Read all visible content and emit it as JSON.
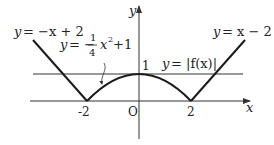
{
  "diagram": {
    "type": "function-graph",
    "axes": {
      "x_label": "x",
      "y_label": "y",
      "origin_label": "O",
      "x_ticks": [
        "-2",
        "2"
      ],
      "y_ticks": [
        "1"
      ]
    },
    "curves": [
      {
        "name": "left-line",
        "equation": "y = -x + 2",
        "label_lhs": "y",
        "label_rhs": "= −x + 2"
      },
      {
        "name": "right-line",
        "equation": "y = x - 2",
        "label_lhs": "y",
        "label_rhs": "= x − 2"
      },
      {
        "name": "parabola",
        "equation": "y = -1/4 x^2 + 1",
        "label_lhs": "y",
        "label_eq": "= −",
        "label_num": "1",
        "label_den": "4",
        "label_tail": "x",
        "label_exp": "2",
        "label_plus": "+1"
      },
      {
        "name": "abs-f",
        "equation": "y = |f(x)|",
        "label_lhs": "y",
        "label_rhs": "= |f(x)|"
      }
    ],
    "horizontal_line": {
      "y": 1
    },
    "colors": {
      "stroke": "#1a1a1a",
      "axis": "#333333",
      "text": "#222222"
    }
  }
}
